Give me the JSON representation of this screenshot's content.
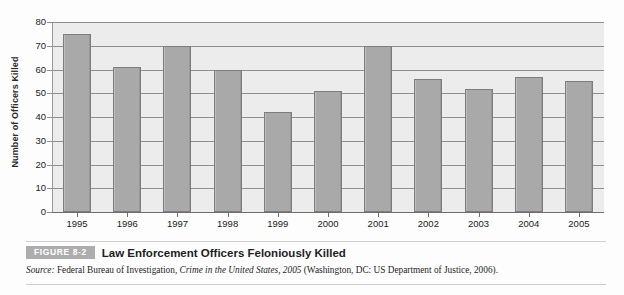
{
  "figure": {
    "badge_label": "FIGURE 8-2",
    "title": "Law Enforcement Officers Feloniously Killed",
    "source_prefix": "Source:",
    "source_agency": " Federal Bureau of Investigation, ",
    "source_publication": "Crime in the United States, 2005",
    "source_suffix": " (Washington, DC: US Department of Justice, 2006)."
  },
  "chart_data": {
    "type": "bar",
    "title": "Law Enforcement Officers Feloniously Killed",
    "xlabel": "",
    "ylabel": "Number of Officers Killed",
    "ylim": [
      0,
      80
    ],
    "ytick_step": 10,
    "grid": true,
    "legend": "none",
    "bar_color": "#a9a9a9",
    "plot_background": "#ececec",
    "categories": [
      "1995",
      "1996",
      "1997",
      "1998",
      "1999",
      "2000",
      "2001",
      "2002",
      "2003",
      "2004",
      "2005"
    ],
    "values": [
      75,
      61,
      70,
      60,
      42,
      51,
      70,
      56,
      52,
      57,
      55
    ],
    "yticks": [
      "0",
      "10",
      "20",
      "30",
      "40",
      "50",
      "60",
      "70",
      "80"
    ]
  }
}
